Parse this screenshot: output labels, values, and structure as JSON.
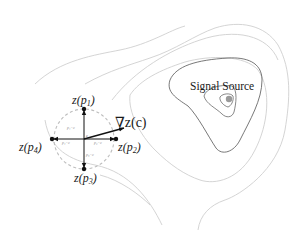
{
  "diagram": {
    "source_label": "Signal Source",
    "gradient_label": "∇z(c)",
    "center_label": "c",
    "points": [
      {
        "id": "p1",
        "label": "z(p",
        "sub": "1",
        "close": ")"
      },
      {
        "id": "p2",
        "label": "z(p",
        "sub": "2",
        "close": ")"
      },
      {
        "id": "p3",
        "label": "z(p",
        "sub": "3",
        "close": ")"
      },
      {
        "id": "p4",
        "label": "z(p",
        "sub": "4",
        "close": ")"
      }
    ],
    "vector_labels": {
      "v1": "p₁−c",
      "v2": "p₂−c",
      "v3": "p₃−c",
      "v4": "p₄−c"
    },
    "colors": {
      "contour": "#c8c8c8",
      "contour_inner": "#555555",
      "source_dot": "#9a9a9a",
      "dashed_circle": "#bdbdbd",
      "arrows": "#111111"
    }
  }
}
